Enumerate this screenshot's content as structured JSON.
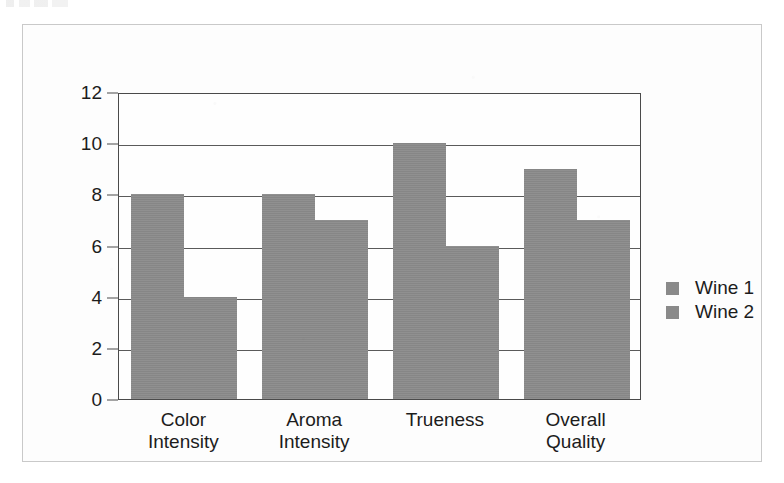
{
  "scan": {
    "artifact_note": "partial-cropped-text-line"
  },
  "chart_data": {
    "type": "bar",
    "title": "",
    "subtitle": "",
    "xlabel": "",
    "ylabel": "",
    "categories": [
      "Color\nIntensity",
      "Aroma\nIntensity",
      "Trueness",
      "Overall\nQuality"
    ],
    "series": [
      {
        "name": "Wine 1",
        "values": [
          8,
          8,
          10,
          9
        ],
        "color": "#8a8a8a"
      },
      {
        "name": "Wine 2",
        "values": [
          4,
          7,
          6,
          7
        ],
        "color": "#8a8a8a"
      }
    ],
    "ylim": [
      0,
      12
    ],
    "ytick_step": 2,
    "yticks": [
      0,
      2,
      4,
      6,
      8,
      10,
      12
    ],
    "ytick_labels": [
      "0",
      "2",
      "4",
      "6",
      "8",
      "10",
      "12"
    ],
    "grid": true,
    "grid_axis": "y",
    "legend": true,
    "legend_position": "right",
    "legend_entries": [
      "Wine 1",
      "Wine 2"
    ],
    "annotations": []
  },
  "style": {
    "bar_color": "#8a8a8a",
    "axis_color": "#4a4a4a",
    "grid_color": "#5a5a5a",
    "text_color": "#1c1c1c",
    "frame_color": "#c9c9c9",
    "plot_background": "#fefefe",
    "page_background": "#fdfdfd"
  }
}
